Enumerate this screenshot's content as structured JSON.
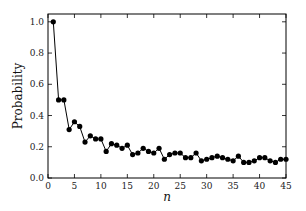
{
  "chart_data": {
    "type": "line",
    "title": "",
    "xlabel": "n",
    "ylabel": "Probability",
    "xlim": [
      0,
      45
    ],
    "ylim": [
      0,
      1.05
    ],
    "xticks": [
      0,
      5,
      10,
      15,
      20,
      25,
      30,
      35,
      40,
      45
    ],
    "yticks": [
      0.0,
      0.2,
      0.4,
      0.6,
      0.8,
      1.0
    ],
    "xtick_labels": [
      "0",
      "5",
      "10",
      "15",
      "20",
      "25",
      "30",
      "35",
      "40",
      "45"
    ],
    "ytick_labels": [
      "0.0",
      "0.2",
      "0.4",
      "0.6",
      "0.8",
      "1.0"
    ],
    "grid": false,
    "legend": null,
    "series": [
      {
        "name": "Probability",
        "color": "#000000",
        "marker": "circle",
        "x": [
          1,
          2,
          3,
          4,
          5,
          6,
          7,
          8,
          9,
          10,
          11,
          12,
          13,
          14,
          15,
          16,
          17,
          18,
          19,
          20,
          21,
          22,
          23,
          24,
          25,
          26,
          27,
          28,
          29,
          30,
          31,
          32,
          33,
          34,
          35,
          36,
          37,
          38,
          39,
          40,
          41,
          42,
          43,
          44,
          45
        ],
        "values": [
          1.0,
          0.5,
          0.5,
          0.31,
          0.36,
          0.33,
          0.23,
          0.27,
          0.25,
          0.25,
          0.17,
          0.22,
          0.21,
          0.19,
          0.21,
          0.15,
          0.16,
          0.19,
          0.17,
          0.16,
          0.19,
          0.12,
          0.15,
          0.16,
          0.16,
          0.13,
          0.13,
          0.16,
          0.11,
          0.12,
          0.13,
          0.14,
          0.13,
          0.12,
          0.11,
          0.14,
          0.1,
          0.1,
          0.11,
          0.13,
          0.13,
          0.11,
          0.1,
          0.12,
          0.12
        ]
      }
    ]
  }
}
